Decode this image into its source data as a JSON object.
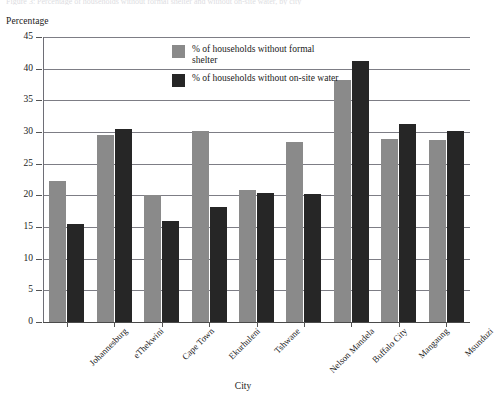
{
  "figure": {
    "cut_off_header": "Figure 3: Percentage of households without formal shelter and without on-site water, by city",
    "xlabel": "City",
    "ylabel": "Percentage"
  },
  "chart_data": {
    "type": "bar",
    "title": "",
    "xlabel": "City",
    "ylabel": "Percentage",
    "ylim": [
      0,
      45
    ],
    "ytick_step": 5,
    "yticks": [
      "45",
      "40",
      "35",
      "30",
      "25",
      "20",
      "15",
      "10",
      "5",
      "0"
    ],
    "grid": true,
    "legend_position": "top-center-inside",
    "categories": [
      "Johannesburg",
      "eThekwini",
      "Cape Town",
      "Ekurhuleni",
      "Tshwane",
      "Nelson Mandela",
      "Buffalo City",
      "Mangaung",
      "Msunduzi"
    ],
    "series": [
      {
        "name": "% of households without formal shelter",
        "color": "#8a8a8a",
        "values": [
          22.3,
          29.5,
          20.0,
          30.2,
          20.8,
          28.4,
          38.2,
          28.9,
          28.7
        ]
      },
      {
        "name": "% of households without on-site water",
        "color": "#262626",
        "values": [
          15.5,
          30.5,
          16.0,
          18.2,
          20.3,
          20.2,
          41.2,
          31.2,
          30.2
        ]
      }
    ]
  }
}
